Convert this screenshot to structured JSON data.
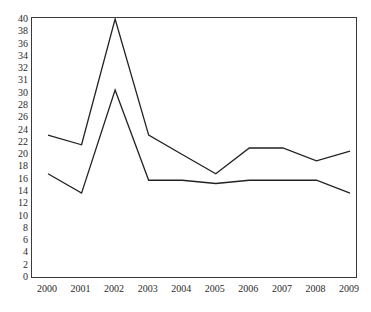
{
  "chart_data": {
    "type": "line",
    "title": "",
    "subtitle": "",
    "xlabel": "",
    "ylabel": "",
    "categories": [
      "2000",
      "2001",
      "2002",
      "2003",
      "2004",
      "2005",
      "2006",
      "2007",
      "2008",
      "2009"
    ],
    "x_tick_labels": [
      "2000",
      "2001",
      "2002",
      "2003",
      "2004",
      "2005",
      "2006",
      "2007",
      "2008",
      "2009"
    ],
    "y_tick_labels": [
      "40",
      "38",
      "36",
      "34",
      "32",
      "31",
      "30",
      "28",
      "26",
      "24",
      "22",
      "20",
      "18",
      "16",
      "14",
      "12",
      "10",
      "8",
      "6",
      "4",
      "2",
      "0"
    ],
    "y_tick_values": [
      40,
      38,
      36,
      34,
      32,
      31,
      30,
      28,
      26,
      24,
      22,
      20,
      18,
      16,
      14,
      12,
      10,
      8,
      6,
      4,
      2,
      0
    ],
    "ylim": [
      0,
      40
    ],
    "xlim": [
      "2000",
      "2009"
    ],
    "grid": false,
    "legend": "none",
    "series": [
      {
        "name": "upper-series",
        "color": "#222222",
        "values": [
          22,
          20.5,
          40,
          22,
          19,
          16,
          20,
          20,
          18,
          19.5
        ]
      },
      {
        "name": "lower-series",
        "color": "#222222",
        "values": [
          16,
          13,
          29,
          15,
          15,
          14.5,
          15,
          15,
          15,
          13
        ]
      }
    ]
  },
  "style": {
    "axis_color": "#3a3a3a",
    "text_color": "#2b2b2b",
    "background": "#ffffff"
  }
}
